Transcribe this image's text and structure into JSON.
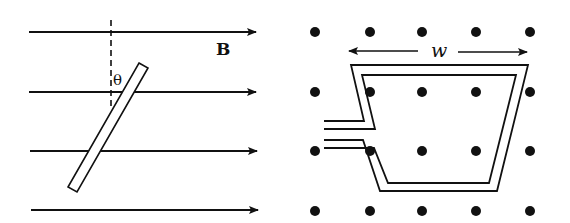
{
  "figure": {
    "left_panel": {
      "field_label": "B",
      "angle_label": "θ",
      "field_lines": [
        {
          "y": 32,
          "x1": 29,
          "x2": 256
        },
        {
          "y": 92,
          "x1": 29,
          "x2": 256
        },
        {
          "y": 151,
          "x1": 30,
          "x2": 257
        },
        {
          "y": 210,
          "x1": 31,
          "x2": 258
        }
      ],
      "field_direction": "right",
      "rod_description": "thin rectangular rod tilted at angle θ from vertical"
    },
    "right_panel": {
      "width_label": "w",
      "field_symbol": "dots (field out of page)",
      "dot_columns_x": [
        315,
        370,
        422,
        476,
        530
      ],
      "dot_rows_y": [
        32,
        92,
        151,
        211
      ],
      "loop_description": "trapezoidal double-wire loop with two leads on the left"
    },
    "colors": {
      "ink": "#111111",
      "background": "#ffffff"
    }
  }
}
